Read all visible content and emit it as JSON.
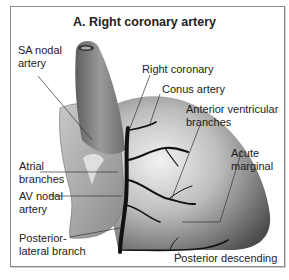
{
  "title": "A. Right coronary artery",
  "labels": {
    "sa_nodal": [
      "SA nodal",
      "artery"
    ],
    "right_coronary": "Right coronary",
    "conus_artery": "Conus artery",
    "anterior_ventricular": [
      "Anterior ventricular",
      "branches"
    ],
    "atrial_branches": [
      "Atrial",
      "branches"
    ],
    "acute_marginal": [
      "Acute",
      "marginal"
    ],
    "av_nodal": [
      "AV nodal",
      "artery"
    ],
    "posterior_lateral": [
      "Posterior-",
      "lateral branch"
    ],
    "posterior_descending": "Posterior descending"
  },
  "colors": {
    "frame": "#8a8a8a",
    "artery": "#111111",
    "leader": "#333333",
    "heart_dark": "#4a4a4a",
    "heart_light": "#e6e6e6"
  }
}
